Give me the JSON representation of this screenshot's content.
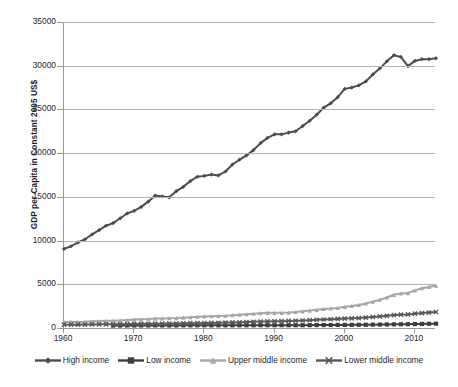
{
  "chart_data": {
    "type": "line",
    "title": "",
    "xlabel": "",
    "ylabel": "GDP per Capita in Constant 2005 US$",
    "xlim": [
      1960,
      2013
    ],
    "ylim": [
      0,
      35000
    ],
    "grid": true,
    "legend_position": "bottom",
    "x_tick_labels": [
      "1960",
      "1970",
      "1980",
      "1990",
      "2000",
      "2010"
    ],
    "x_ticks": [
      1960,
      1970,
      1980,
      1990,
      2000,
      2010
    ],
    "y_tick_labels": [
      "0",
      "5000",
      "10000",
      "15000",
      "20000",
      "25000",
      "30000",
      "35000"
    ],
    "y_ticks": [
      0,
      5000,
      10000,
      15000,
      20000,
      25000,
      30000,
      35000
    ],
    "x": [
      1960,
      1961,
      1962,
      1963,
      1964,
      1965,
      1966,
      1967,
      1968,
      1969,
      1970,
      1971,
      1972,
      1973,
      1974,
      1975,
      1976,
      1977,
      1978,
      1979,
      1980,
      1981,
      1982,
      1983,
      1984,
      1985,
      1986,
      1987,
      1988,
      1989,
      1990,
      1991,
      1992,
      1993,
      1994,
      1995,
      1996,
      1997,
      1998,
      1999,
      2000,
      2001,
      2002,
      2003,
      2004,
      2005,
      2006,
      2007,
      2008,
      2009,
      2010,
      2011,
      2012,
      2013
    ],
    "series": [
      {
        "name": "High income",
        "color": "#4d4d4d",
        "marker": "diamond",
        "values": [
          9050,
          9350,
          9800,
          10150,
          10700,
          11200,
          11700,
          12000,
          12550,
          13100,
          13400,
          13850,
          14450,
          15150,
          15050,
          14950,
          15650,
          16150,
          16800,
          17300,
          17400,
          17550,
          17450,
          17900,
          18700,
          19250,
          19750,
          20350,
          21150,
          21750,
          22150,
          22150,
          22350,
          22500,
          23100,
          23700,
          24400,
          25200,
          25700,
          26400,
          27350,
          27500,
          27750,
          28200,
          29000,
          29700,
          30500,
          31200,
          31000,
          29950,
          30550,
          30750,
          30750,
          30850
        ]
      },
      {
        "name": "Low income",
        "color": "#3d3d3d",
        "marker": "square",
        "values": [
          null,
          null,
          null,
          null,
          null,
          null,
          null,
          280,
          282,
          288,
          292,
          293,
          292,
          298,
          296,
          293,
          297,
          302,
          305,
          308,
          308,
          306,
          304,
          303,
          306,
          309,
          310,
          313,
          315,
          318,
          318,
          316,
          316,
          317,
          321,
          326,
          332,
          337,
          341,
          345,
          352,
          358,
          362,
          371,
          382,
          394,
          406,
          420,
          430,
          434,
          450,
          465,
          480,
          495
        ]
      },
      {
        "name": "Upper middle income",
        "color": "#a6a6a6",
        "marker": "triangle",
        "values": [
          700,
          715,
          700,
          720,
          770,
          790,
          820,
          830,
          870,
          910,
          960,
          990,
          1020,
          1080,
          1100,
          1120,
          1130,
          1180,
          1230,
          1280,
          1320,
          1350,
          1370,
          1400,
          1470,
          1520,
          1570,
          1630,
          1700,
          1740,
          1740,
          1730,
          1770,
          1830,
          1910,
          1990,
          2080,
          2180,
          2230,
          2300,
          2420,
          2520,
          2640,
          2810,
          3020,
          3240,
          3490,
          3800,
          3960,
          4000,
          4300,
          4550,
          4700,
          4850
        ]
      },
      {
        "name": "Lower middle income",
        "color": "#595959",
        "marker": "cross",
        "values": [
          380,
          385,
          385,
          395,
          410,
          415,
          415,
          425,
          440,
          455,
          470,
          475,
          480,
          495,
          500,
          510,
          515,
          535,
          555,
          555,
          565,
          585,
          600,
          620,
          640,
          660,
          680,
          705,
          730,
          755,
          775,
          785,
          805,
          830,
          860,
          900,
          940,
          975,
          1000,
          1035,
          1080,
          1105,
          1135,
          1190,
          1255,
          1320,
          1395,
          1480,
          1520,
          1550,
          1635,
          1705,
          1765,
          1830
        ]
      }
    ]
  },
  "legend": {
    "items": [
      {
        "label": "High income",
        "color": "#4d4d4d"
      },
      {
        "label": "Low income",
        "color": "#3d3d3d"
      },
      {
        "label": "Upper middle income",
        "color": "#a6a6a6"
      },
      {
        "label": "Lower middle income",
        "color": "#595959"
      }
    ]
  }
}
